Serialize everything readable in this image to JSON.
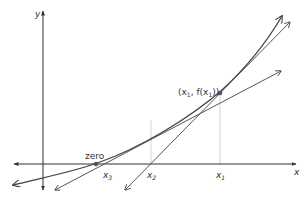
{
  "diagram": {
    "title": "",
    "axes": {
      "x_label": "x",
      "y_label": "y"
    },
    "labels": {
      "point": "(x₁, f(x₁))",
      "point_prefix": "(x",
      "point_sub1": "1",
      "point_mid": ", f(x",
      "point_sub2": "1",
      "point_suffix": "))",
      "zero": "zero",
      "x1": "x",
      "x1_sub": "1",
      "x2": "x",
      "x2_sub": "2",
      "x3": "x",
      "x3_sub": "3"
    },
    "colors": {
      "axis": "#333333",
      "curve": "#444444",
      "tangent": "#555555",
      "guide": "#bbbbbb",
      "point": "#555555"
    }
  }
}
